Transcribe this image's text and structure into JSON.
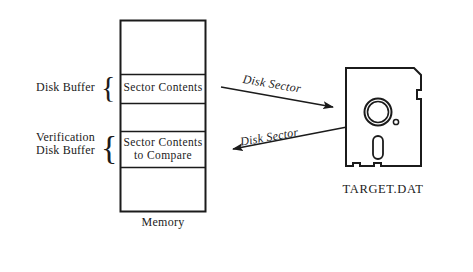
{
  "figure": {
    "ink_color": "#1b1b1b",
    "background_color": "#ffffff"
  },
  "memory": {
    "caption": "Memory",
    "cells": [
      {
        "label": "",
        "filled": false
      },
      {
        "label": "Sector Contents",
        "filled": true
      },
      {
        "label": "",
        "filled": false
      },
      {
        "label": "Sector Contents\nto Compare",
        "filled": true
      },
      {
        "label": "",
        "filled": false
      }
    ],
    "groups": [
      {
        "label": "Disk Buffer",
        "brace": "{"
      },
      {
        "label": "Verification\nDisk Buffer",
        "brace": "{"
      }
    ]
  },
  "disk": {
    "caption": "TARGET.DAT",
    "parts": {
      "body": "floppy-disk-body",
      "hub": "hub-ring",
      "index_hole": "index-hole",
      "head_slot": "head-slot",
      "write_protect_notch": "write-protect-notch"
    }
  },
  "arrows": [
    {
      "id": "read",
      "label": "Disk Sector",
      "direction": "memory-to-disk"
    },
    {
      "id": "verify",
      "label": "Disk Sector",
      "direction": "disk-to-memory"
    }
  ]
}
